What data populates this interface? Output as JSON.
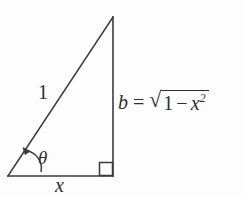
{
  "figure": {
    "type": "right-triangle-diagram",
    "background_color": "#fdfdfd",
    "stroke_color": "#3a3a3a",
    "labels": {
      "hypotenuse": "1",
      "base": "x",
      "angle": "θ"
    },
    "equation": {
      "left_side": "b",
      "operator": "=",
      "radical_sign": "√",
      "radicand_first": "1",
      "radicand_minus": "−",
      "radicand_variable": "x",
      "radicand_exponent": "2",
      "full_text": "b = √(1 − x²)"
    },
    "geometry": {
      "apex": [
        113,
        17
      ],
      "bottom_left": [
        8,
        176
      ],
      "bottom_right": [
        113,
        176
      ],
      "right_angle_marker": "square",
      "angle_arc_label": "θ"
    }
  }
}
